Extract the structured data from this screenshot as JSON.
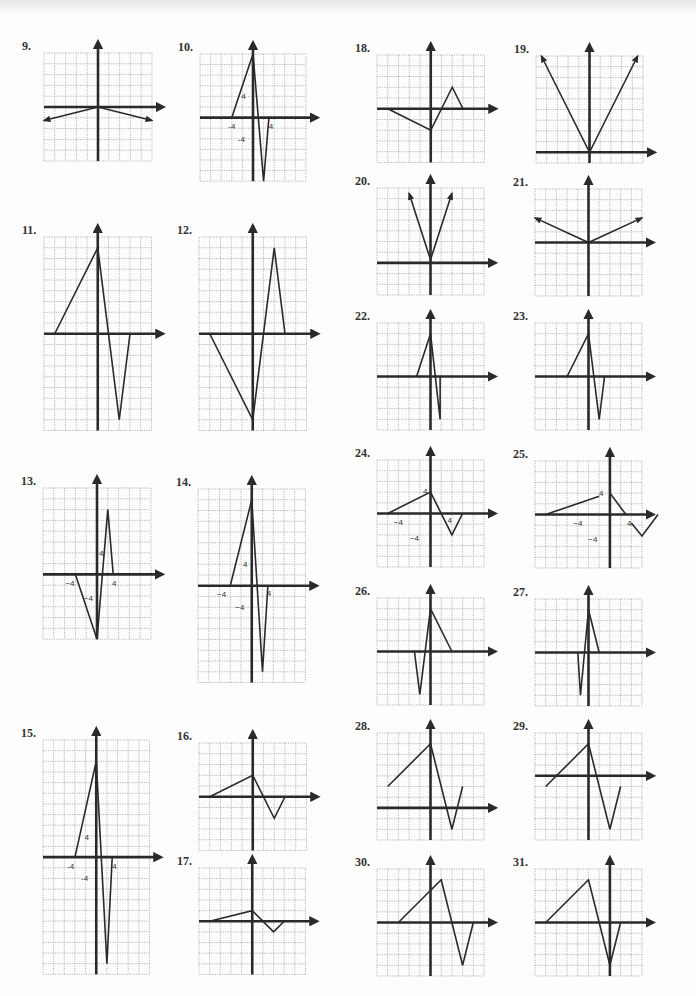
{
  "page": {
    "colors": {
      "ink": "#2a2a2a",
      "grid": "#999999",
      "paper": "#fdfdfd"
    }
  },
  "chart_data": [
    {
      "id": "9",
      "label": "9.",
      "type": "line",
      "x": 44,
      "y": 53,
      "cols": 10,
      "rows": 10,
      "cell": 10.8,
      "ox": 5,
      "oy": 5,
      "points": [
        [
          -5,
          -1.25
        ],
        [
          0,
          0
        ],
        [
          5,
          -1.25
        ]
      ],
      "arrow_start": true,
      "arrow_end": true,
      "labels": []
    },
    {
      "id": "10",
      "label": "10.",
      "type": "line",
      "x": 200,
      "y": 54,
      "cols": 10,
      "rows": 12,
      "cell": 10.6,
      "ox": 5,
      "oy": 6,
      "points": [
        [
          -2,
          0
        ],
        [
          0,
          6
        ],
        [
          1,
          -6
        ],
        [
          1.5,
          0
        ]
      ],
      "arrow_start": false,
      "arrow_end": false,
      "labels": [
        {
          "t": "-4",
          "gx": -2,
          "gy": -0.8
        },
        {
          "t": "4",
          "gx": 1.7,
          "gy": -0.8
        },
        {
          "t": "4",
          "gx": -0.9,
          "gy": 2
        },
        {
          "t": "-4",
          "gx": -1.1,
          "gy": -2
        }
      ]
    },
    {
      "id": "11",
      "label": "11.",
      "type": "line",
      "x": 44,
      "y": 237,
      "cols": 10,
      "rows": 18,
      "cell": 10.75,
      "ox": 5,
      "oy": 9,
      "points": [
        [
          -4,
          0
        ],
        [
          0,
          8
        ],
        [
          2,
          -8
        ],
        [
          3,
          0
        ]
      ],
      "arrow_start": false,
      "arrow_end": false,
      "labels": []
    },
    {
      "id": "12",
      "label": "12.",
      "type": "line",
      "x": 199,
      "y": 237,
      "cols": 10,
      "rows": 18,
      "cell": 10.75,
      "ox": 5,
      "oy": 9,
      "points": [
        [
          -4,
          0
        ],
        [
          0,
          -8
        ],
        [
          2,
          8
        ],
        [
          3,
          0
        ]
      ],
      "arrow_start": false,
      "arrow_end": false,
      "labels": []
    },
    {
      "id": "13",
      "label": "13.",
      "type": "line",
      "x": 43,
      "y": 488,
      "cols": 10,
      "rows": 14,
      "cell": 10.8,
      "ox": 5,
      "oy": 8,
      "points": [
        [
          -2,
          0
        ],
        [
          0,
          -6
        ],
        [
          1,
          6
        ],
        [
          1.5,
          0
        ]
      ],
      "arrow_start": false,
      "arrow_end": false,
      "labels": [
        {
          "t": "−4",
          "gx": -2.5,
          "gy": -0.8
        },
        {
          "t": "4",
          "gx": 1.6,
          "gy": -0.8
        },
        {
          "t": "4",
          "gx": 0.4,
          "gy": 2
        },
        {
          "t": "−4",
          "gx": -0.8,
          "gy": -2.2
        }
      ]
    },
    {
      "id": "14",
      "label": "14.",
      "type": "line",
      "x": 198,
      "y": 489,
      "cols": 10,
      "rows": 18,
      "cell": 10.75,
      "ox": 5,
      "oy": 9,
      "points": [
        [
          -2,
          0
        ],
        [
          0,
          8
        ],
        [
          1,
          -8
        ],
        [
          1.5,
          0
        ]
      ],
      "arrow_start": false,
      "arrow_end": false,
      "labels": [
        {
          "t": "−4",
          "gx": -2.8,
          "gy": -0.8
        },
        {
          "t": "4",
          "gx": 1.6,
          "gy": -0.7
        },
        {
          "t": "4",
          "gx": -0.6,
          "gy": 2
        },
        {
          "t": "−4",
          "gx": -1.1,
          "gy": -2
        }
      ]
    },
    {
      "id": "15",
      "label": "15.",
      "type": "line",
      "x": 43,
      "y": 740,
      "cols": 10,
      "rows": 22,
      "cell": 10.65,
      "ox": 5,
      "oy": 11,
      "points": [
        [
          -2,
          0
        ],
        [
          0,
          9
        ],
        [
          1,
          -10
        ],
        [
          1.5,
          0
        ]
      ],
      "arrow_start": false,
      "arrow_end": false,
      "labels": [
        {
          "t": "-4",
          "gx": -2.4,
          "gy": -0.8
        },
        {
          "t": "4",
          "gx": 1.7,
          "gy": -0.8
        },
        {
          "t": "4",
          "gx": -0.9,
          "gy": 1.9
        },
        {
          "t": "-4",
          "gx": -1.1,
          "gy": -2
        }
      ]
    },
    {
      "id": "16",
      "label": "16.",
      "type": "line",
      "x": 199,
      "y": 743,
      "cols": 10,
      "rows": 10,
      "cell": 10.75,
      "ox": 5,
      "oy": 5,
      "points": [
        [
          -4,
          0
        ],
        [
          0,
          2
        ],
        [
          2,
          -2
        ],
        [
          3,
          0
        ]
      ],
      "arrow_start": false,
      "arrow_end": false,
      "labels": []
    },
    {
      "id": "17",
      "label": "17.",
      "type": "line",
      "x": 199,
      "y": 868,
      "cols": 10,
      "rows": 10,
      "cell": 10.65,
      "ox": 5,
      "oy": 5,
      "points": [
        [
          -4,
          0
        ],
        [
          0,
          1
        ],
        [
          2,
          -1
        ],
        [
          3,
          0
        ]
      ],
      "arrow_start": false,
      "arrow_end": false,
      "labels": []
    },
    {
      "id": "18",
      "label": "18.",
      "type": "line",
      "x": 377,
      "y": 55,
      "cols": 10,
      "rows": 10,
      "cell": 10.75,
      "ox": 5,
      "oy": 5,
      "points": [
        [
          -4,
          0
        ],
        [
          0,
          -2
        ],
        [
          2,
          2
        ],
        [
          3,
          0
        ]
      ],
      "arrow_start": false,
      "arrow_end": false,
      "labels": []
    },
    {
      "id": "19",
      "label": "19.",
      "type": "line",
      "x": 536,
      "y": 56,
      "cols": 10,
      "rows": 10,
      "cell": 10.7,
      "ox": 5,
      "oy": 9,
      "points": [
        [
          -4.5,
          9
        ],
        [
          0,
          0
        ],
        [
          4.5,
          9
        ]
      ],
      "arrow_start": true,
      "arrow_end": true,
      "labels": []
    },
    {
      "id": "20",
      "label": "20.",
      "type": "line",
      "x": 377,
      "y": 188,
      "cols": 10,
      "rows": 10,
      "cell": 10.7,
      "ox": 5,
      "oy": 7,
      "points": [
        [
          -2,
          6.5
        ],
        [
          0,
          0.3
        ],
        [
          2,
          6.5
        ]
      ],
      "arrow_start": true,
      "arrow_end": true,
      "labels": []
    },
    {
      "id": "21",
      "label": "21.",
      "type": "line",
      "x": 535,
      "y": 189,
      "cols": 10,
      "rows": 10,
      "cell": 10.7,
      "ox": 5,
      "oy": 5,
      "points": [
        [
          -5,
          2.3
        ],
        [
          0,
          0
        ],
        [
          5,
          2.3
        ]
      ],
      "arrow_start": true,
      "arrow_end": true,
      "labels": []
    },
    {
      "id": "22",
      "label": "22.",
      "type": "line",
      "x": 377,
      "y": 323,
      "cols": 10,
      "rows": 10,
      "cell": 10.7,
      "ox": 5,
      "oy": 5,
      "points": [
        [
          -1.3,
          0
        ],
        [
          0,
          4
        ],
        [
          0.9,
          -4
        ],
        [
          0.9,
          0
        ]
      ],
      "arrow_start": false,
      "arrow_end": false,
      "labels": []
    },
    {
      "id": "23",
      "label": "23.",
      "type": "line",
      "x": 535,
      "y": 323,
      "cols": 10,
      "rows": 10,
      "cell": 10.7,
      "ox": 5,
      "oy": 5,
      "points": [
        [
          -2,
          0
        ],
        [
          0,
          4
        ],
        [
          1,
          -4
        ],
        [
          1.5,
          0
        ]
      ],
      "arrow_start": false,
      "arrow_end": false,
      "labels": []
    },
    {
      "id": "24",
      "label": "24.",
      "type": "line",
      "x": 377,
      "y": 460,
      "cols": 10,
      "rows": 10,
      "cell": 10.7,
      "ox": 5,
      "oy": 5,
      "points": [
        [
          -4,
          0
        ],
        [
          0,
          2
        ],
        [
          2,
          -2
        ],
        [
          3,
          0
        ]
      ],
      "arrow_start": false,
      "arrow_end": false,
      "labels": [
        {
          "t": "4",
          "gx": -0.5,
          "gy": 2.1
        },
        {
          "t": "−4",
          "gx": -3,
          "gy": -0.8
        },
        {
          "t": "4",
          "gx": 1.8,
          "gy": -0.6
        },
        {
          "t": "−4",
          "gx": -1.5,
          "gy": -2.3
        }
      ]
    },
    {
      "id": "25",
      "label": "25.",
      "type": "line",
      "x": 535,
      "y": 461,
      "cols": 10,
      "rows": 10,
      "cell": 10.7,
      "ox": 7,
      "oy": 5,
      "points": [
        [
          -6,
          0
        ],
        [
          -1,
          1.7
        ],
        null,
        [
          0,
          2
        ],
        [
          1.5,
          0
        ],
        null,
        [
          2,
          -0.8
        ],
        [
          3,
          -2
        ],
        [
          4.5,
          0
        ]
      ],
      "arrow_start": false,
      "arrow_end": false,
      "labels": [
        {
          "t": "4",
          "gx": -0.8,
          "gy": 2
        },
        {
          "t": "−4",
          "gx": -3,
          "gy": -0.8
        },
        {
          "t": "4",
          "gx": 1.8,
          "gy": -0.8
        },
        {
          "t": "−4",
          "gx": -1.6,
          "gy": -2.3
        }
      ]
    },
    {
      "id": "26",
      "label": "26.",
      "type": "line",
      "x": 377,
      "y": 598,
      "cols": 10,
      "rows": 10,
      "cell": 10.7,
      "ox": 5,
      "oy": 5,
      "points": [
        [
          -1.5,
          0
        ],
        [
          -1,
          -4
        ],
        [
          0,
          4
        ],
        [
          2,
          0
        ]
      ],
      "arrow_start": false,
      "arrow_end": false,
      "labels": []
    },
    {
      "id": "27",
      "label": "27.",
      "type": "line",
      "x": 535,
      "y": 599,
      "cols": 10,
      "rows": 10,
      "cell": 10.7,
      "ox": 5,
      "oy": 5,
      "points": [
        [
          -1,
          0
        ],
        [
          -0.75,
          -4
        ],
        [
          0,
          4
        ],
        [
          1,
          0
        ]
      ],
      "arrow_start": false,
      "arrow_end": false,
      "labels": []
    },
    {
      "id": "28",
      "label": "28.",
      "type": "line",
      "x": 377,
      "y": 733,
      "cols": 10,
      "rows": 10,
      "cell": 10.7,
      "ox": 5,
      "oy": 7,
      "points": [
        [
          -4,
          2
        ],
        [
          0,
          6
        ],
        [
          2,
          -2
        ],
        [
          3,
          2
        ]
      ],
      "arrow_start": false,
      "arrow_end": false,
      "labels": []
    },
    {
      "id": "29",
      "label": "29.",
      "type": "line",
      "x": 535,
      "y": 733,
      "cols": 10,
      "rows": 10,
      "cell": 10.7,
      "ox": 5,
      "oy": 4,
      "points": [
        [
          -4,
          -1
        ],
        [
          0,
          3
        ],
        [
          2,
          -5
        ],
        [
          3,
          -1
        ]
      ],
      "arrow_start": false,
      "arrow_end": false,
      "labels": []
    },
    {
      "id": "30",
      "label": "30.",
      "type": "line",
      "x": 377,
      "y": 869,
      "cols": 10,
      "rows": 10,
      "cell": 10.7,
      "ox": 5,
      "oy": 5,
      "points": [
        [
          -3,
          0
        ],
        [
          1,
          4
        ],
        [
          3,
          -4
        ],
        [
          4,
          0
        ]
      ],
      "arrow_start": false,
      "arrow_end": false,
      "labels": []
    },
    {
      "id": "31",
      "label": "31.",
      "type": "line",
      "x": 535,
      "y": 869,
      "cols": 10,
      "rows": 10,
      "cell": 10.7,
      "ox": 7,
      "oy": 5,
      "points": [
        [
          -6,
          0
        ],
        [
          -2,
          4
        ],
        [
          0,
          -4
        ],
        [
          1,
          0
        ]
      ],
      "arrow_start": false,
      "arrow_end": false,
      "labels": []
    }
  ]
}
